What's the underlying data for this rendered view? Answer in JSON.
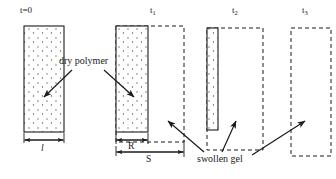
{
  "diagram": {
    "stages": [
      {
        "id": "stage-0",
        "time_label": "t=0",
        "time_base": "t=0",
        "time_sub": "",
        "dry_box": {
          "x": 24,
          "y": 26,
          "w": 40,
          "h": 106
        },
        "gel_box": null,
        "dimension": {
          "label": "l",
          "x": 24,
          "w": 40,
          "y": 140
        }
      },
      {
        "id": "stage-1",
        "time_label": "t1",
        "time_base": "t",
        "time_sub": "1",
        "dry_box": {
          "x": 116,
          "y": 26,
          "w": 32,
          "h": 106
        },
        "gel_box": {
          "x": 116,
          "y": 26,
          "w": 68,
          "h": 116
        },
        "dimension_r": {
          "label": "R",
          "x": 116,
          "w": 32,
          "y": 140
        },
        "dimension_s": {
          "label": "S",
          "x": 116,
          "w": 68,
          "y": 152
        }
      },
      {
        "id": "stage-2",
        "time_label": "t2",
        "time_base": "t",
        "time_sub": "2",
        "dry_box": {
          "x": 207,
          "y": 28,
          "w": 11,
          "h": 102
        },
        "gel_box": {
          "x": 207,
          "y": 28,
          "w": 56,
          "h": 122
        }
      },
      {
        "id": "stage-3",
        "time_label": "t3",
        "time_base": "t",
        "time_sub": "3",
        "dry_box": null,
        "gel_box": {
          "x": 291,
          "y": 28,
          "w": 40,
          "h": 128
        }
      }
    ],
    "annotations": {
      "dry_polymer": {
        "text": "dry polymer",
        "x": 59,
        "y": 61
      },
      "swollen_gel": {
        "text": "swollen gel",
        "x": 197,
        "y": 159
      }
    },
    "dimension_labels": {
      "l": "l",
      "R": "R",
      "S": "S"
    },
    "colors": {
      "stroke": "#1a1a1a",
      "stipple": "#555555",
      "background": "#ffffff"
    }
  }
}
